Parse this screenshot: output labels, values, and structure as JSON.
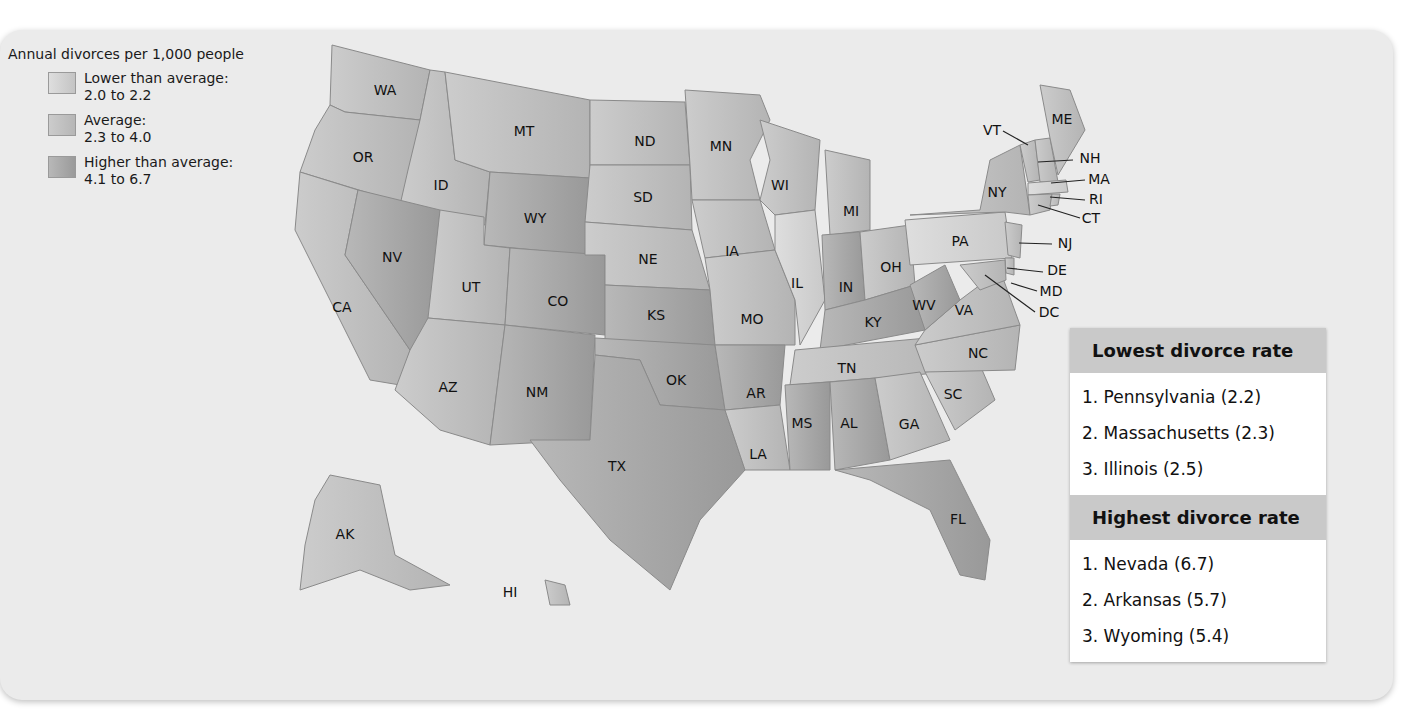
{
  "legend": {
    "title": "Annual divorces per 1,000 people",
    "items": [
      {
        "label": "Lower than average:",
        "range": "2.0 to 2.2",
        "color": "#d6d6d6"
      },
      {
        "label": "Average:",
        "range": "2.3  to 4.0",
        "color": "#c2c2c2"
      },
      {
        "label": "Higher than average:",
        "range": "4.1 to 6.7",
        "color": "#a6a6a6"
      }
    ]
  },
  "map": {
    "state_labels": [
      "WA",
      "OR",
      "CA",
      "ID",
      "NV",
      "MT",
      "WY",
      "UT",
      "CO",
      "AZ",
      "NM",
      "ND",
      "SD",
      "NE",
      "KS",
      "OK",
      "TX",
      "MN",
      "IA",
      "MO",
      "AR",
      "LA",
      "WI",
      "IL",
      "MI",
      "IN",
      "OH",
      "KY",
      "TN",
      "MS",
      "AL",
      "GA",
      "FL",
      "SC",
      "NC",
      "VA",
      "WV",
      "PA",
      "NY",
      "VT",
      "ME",
      "NH",
      "MA",
      "RI",
      "CT",
      "NJ",
      "DE",
      "MD",
      "DC",
      "AK",
      "HI"
    ]
  },
  "lowest": {
    "title": "Lowest divorce rate",
    "items": [
      "1. Pennsylvania (2.2)",
      "2. Massachusetts (2.3)",
      "3. Illinois (2.5)"
    ]
  },
  "highest": {
    "title": "Highest divorce rate",
    "items": [
      "1. Nevada (6.7)",
      "2. Arkansas (5.7)",
      "3. Wyoming (5.4)"
    ]
  }
}
